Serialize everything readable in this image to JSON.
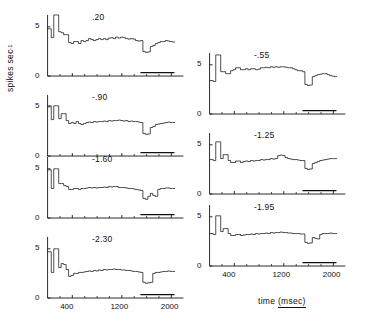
{
  "figure": {
    "axis_y_title": "spikes  sec",
    "axis_y_exponent": "-1",
    "axis_x_title_main": "time",
    "axis_x_title_unit": "(msec)"
  },
  "chart_data": {
    "type": "line",
    "title": "",
    "xlabel": "time (msec)",
    "ylabel": "spikes sec-1",
    "xlim": [
      0,
      2100
    ],
    "ylim": [
      0,
      6.2
    ],
    "xticks": [
      400,
      1200,
      2000
    ],
    "xticklabels": [
      "400",
      "1200",
      "2000"
    ],
    "yticks": [
      0,
      5
    ],
    "yticklabels": [
      "0",
      "5"
    ],
    "grid": false,
    "legend": "none",
    "stimulus_marker": {
      "label": "",
      "x_start": 1500,
      "x_end": 2050,
      "y": 0.35
    },
    "panels": [
      {
        "name": "panel-0-20",
        "label": ".20",
        "column": "left",
        "x": [
          0,
          60,
          100,
          140,
          180,
          220,
          260,
          300,
          340,
          380,
          420,
          460,
          500,
          540,
          580,
          620,
          660,
          700,
          740,
          780,
          820,
          860,
          900,
          940,
          980,
          1020,
          1060,
          1100,
          1140,
          1180,
          1220,
          1260,
          1300,
          1340,
          1380,
          1420,
          1460,
          1500,
          1540,
          1580,
          1620,
          1660,
          1700,
          1740,
          1780,
          1820,
          1860,
          1900,
          1940,
          1980,
          2020,
          2060
        ],
        "y": [
          4.8,
          3.9,
          6.2,
          6.2,
          4.5,
          4.4,
          4.2,
          4.2,
          3.4,
          3.3,
          3.5,
          3.5,
          3.3,
          3.6,
          3.5,
          3.6,
          3.8,
          3.7,
          3.6,
          3.7,
          3.8,
          3.7,
          3.8,
          3.7,
          3.85,
          3.9,
          3.8,
          3.95,
          3.85,
          3.95,
          3.9,
          3.8,
          3.75,
          3.8,
          3.75,
          3.6,
          3.55,
          3.6,
          2.5,
          2.4,
          2.45,
          3.0,
          3.1,
          3.3,
          3.4,
          3.5,
          3.5,
          3.6,
          3.55,
          3.5,
          3.45,
          3.45
        ]
      },
      {
        "name": "panel-minus-90",
        "label": "-.90",
        "column": "left",
        "x": [
          0,
          60,
          100,
          140,
          180,
          220,
          260,
          300,
          340,
          380,
          420,
          460,
          500,
          540,
          580,
          620,
          660,
          700,
          740,
          780,
          820,
          860,
          900,
          940,
          980,
          1020,
          1060,
          1100,
          1140,
          1180,
          1220,
          1260,
          1300,
          1340,
          1380,
          1420,
          1460,
          1500,
          1540,
          1580,
          1620,
          1660,
          1700,
          1740,
          1780,
          1820,
          1860,
          1900,
          1940,
          1980,
          2020,
          2060
        ],
        "y": [
          5.1,
          3.7,
          5.1,
          5.1,
          3.8,
          4.3,
          4.3,
          3.6,
          3.3,
          3.4,
          3.3,
          3.5,
          3.3,
          3.2,
          3.3,
          3.4,
          3.45,
          3.4,
          3.5,
          3.45,
          3.5,
          3.5,
          3.55,
          3.5,
          3.6,
          3.55,
          3.6,
          3.6,
          3.65,
          3.6,
          3.55,
          3.6,
          3.5,
          3.55,
          3.5,
          3.5,
          3.45,
          3.4,
          2.3,
          2.2,
          2.25,
          2.9,
          3.0,
          3.2,
          3.25,
          3.3,
          3.35,
          3.4,
          3.45,
          3.4,
          3.4,
          3.4
        ]
      },
      {
        "name": "panel-minus-1-60",
        "label": "-1.60",
        "column": "left",
        "x": [
          0,
          60,
          100,
          140,
          180,
          220,
          260,
          300,
          340,
          380,
          420,
          460,
          500,
          540,
          580,
          620,
          660,
          700,
          740,
          780,
          820,
          860,
          900,
          940,
          980,
          1020,
          1060,
          1100,
          1140,
          1180,
          1220,
          1260,
          1300,
          1340,
          1380,
          1420,
          1460,
          1500,
          1540,
          1580,
          1620,
          1660,
          1700,
          1740,
          1780,
          1820,
          1860,
          1900,
          1940,
          1980,
          2020,
          2060
        ],
        "y": [
          4.9,
          3.0,
          5.0,
          5.0,
          3.5,
          3.5,
          3.3,
          3.2,
          2.9,
          2.9,
          3.0,
          3.0,
          2.9,
          3.0,
          3.0,
          3.05,
          3.1,
          3.05,
          3.1,
          3.05,
          3.1,
          3.1,
          3.15,
          3.1,
          3.2,
          3.15,
          3.2,
          3.2,
          3.1,
          3.1,
          3.1,
          3.05,
          3.0,
          3.0,
          2.95,
          2.9,
          2.85,
          2.8,
          2.0,
          1.9,
          2.2,
          2.5,
          2.3,
          2.2,
          2.9,
          3.0,
          3.0,
          3.05,
          3.05,
          3.0,
          3.0,
          3.0
        ]
      },
      {
        "name": "panel-minus-2-30",
        "label": "-2.30",
        "column": "left",
        "x": [
          0,
          60,
          100,
          140,
          180,
          220,
          260,
          300,
          340,
          380,
          420,
          460,
          500,
          540,
          580,
          620,
          660,
          700,
          740,
          780,
          820,
          860,
          900,
          940,
          980,
          1020,
          1060,
          1100,
          1140,
          1180,
          1220,
          1260,
          1300,
          1340,
          1380,
          1420,
          1460,
          1500,
          1540,
          1580,
          1620,
          1660,
          1700,
          1740,
          1780,
          1820,
          1860,
          1900,
          1940,
          1980,
          2020,
          2060
        ],
        "y": [
          4.7,
          2.6,
          5.0,
          5.0,
          3.1,
          3.5,
          3.4,
          2.9,
          2.2,
          2.3,
          2.5,
          2.5,
          2.6,
          2.6,
          2.65,
          2.7,
          2.75,
          2.7,
          2.8,
          2.75,
          2.85,
          2.8,
          2.9,
          2.85,
          2.9,
          2.9,
          2.95,
          2.9,
          2.9,
          2.85,
          2.85,
          2.8,
          2.8,
          2.75,
          2.7,
          2.7,
          2.65,
          2.6,
          1.6,
          1.5,
          1.55,
          1.6,
          2.5,
          2.6,
          2.6,
          2.65,
          2.7,
          2.7,
          2.75,
          2.7,
          2.7,
          2.7
        ]
      },
      {
        "name": "panel-minus-55",
        "label": "-.55",
        "column": "right",
        "x": [
          0,
          60,
          100,
          140,
          180,
          220,
          260,
          300,
          340,
          380,
          420,
          460,
          500,
          540,
          580,
          620,
          660,
          700,
          740,
          780,
          820,
          860,
          900,
          940,
          980,
          1020,
          1060,
          1100,
          1140,
          1180,
          1220,
          1260,
          1300,
          1340,
          1380,
          1420,
          1460,
          1500,
          1540,
          1580,
          1620,
          1660,
          1700,
          1740,
          1780,
          1820,
          1860,
          1900,
          1940,
          1980,
          2020,
          2060
        ],
        "y": [
          3.4,
          3.3,
          6.0,
          6.0,
          4.3,
          4.3,
          4.1,
          4.1,
          4.4,
          4.5,
          4.7,
          4.7,
          4.5,
          4.5,
          4.6,
          4.5,
          4.6,
          4.6,
          4.5,
          4.55,
          4.7,
          4.7,
          4.75,
          4.7,
          4.8,
          4.75,
          4.8,
          4.75,
          4.8,
          4.8,
          4.75,
          4.7,
          4.7,
          4.6,
          4.5,
          4.4,
          4.4,
          4.3,
          3.0,
          2.9,
          2.95,
          3.8,
          3.9,
          4.0,
          4.05,
          4.1,
          4.1,
          4.0,
          3.9,
          3.85,
          3.8,
          3.8
        ]
      },
      {
        "name": "panel-minus-1-25",
        "label": "-1.25",
        "column": "right",
        "x": [
          0,
          60,
          100,
          140,
          180,
          220,
          260,
          300,
          340,
          380,
          420,
          460,
          500,
          540,
          580,
          620,
          660,
          700,
          740,
          780,
          820,
          860,
          900,
          940,
          980,
          1020,
          1060,
          1100,
          1140,
          1180,
          1220,
          1260,
          1300,
          1340,
          1380,
          1420,
          1460,
          1500,
          1540,
          1580,
          1620,
          1660,
          1700,
          1740,
          1780,
          1820,
          1860,
          1900,
          1940,
          1980,
          2020,
          2060
        ],
        "y": [
          3.5,
          3.4,
          5.3,
          5.3,
          3.6,
          4.0,
          4.0,
          3.4,
          3.2,
          3.2,
          3.35,
          3.35,
          3.2,
          3.3,
          3.35,
          3.3,
          3.4,
          3.35,
          3.4,
          3.4,
          3.5,
          3.45,
          3.5,
          3.5,
          3.6,
          3.55,
          3.6,
          3.9,
          3.95,
          3.9,
          3.7,
          3.6,
          3.55,
          3.5,
          3.5,
          3.45,
          3.4,
          3.4,
          2.6,
          2.5,
          2.55,
          3.1,
          3.2,
          3.3,
          3.4,
          3.45,
          3.5,
          3.55,
          3.6,
          3.6,
          3.6,
          3.6
        ]
      },
      {
        "name": "panel-minus-1-95",
        "label": "-1.95",
        "column": "right",
        "x": [
          0,
          60,
          100,
          140,
          180,
          220,
          260,
          300,
          340,
          380,
          420,
          460,
          500,
          540,
          580,
          620,
          660,
          700,
          740,
          780,
          820,
          860,
          900,
          940,
          980,
          1020,
          1060,
          1100,
          1140,
          1180,
          1220,
          1260,
          1300,
          1340,
          1380,
          1420,
          1460,
          1500,
          1540,
          1580,
          1620,
          1660,
          1700,
          1740,
          1780,
          1820,
          1860,
          1900,
          1940,
          1980,
          2020,
          2060
        ],
        "y": [
          3.3,
          3.2,
          5.1,
          5.1,
          3.5,
          3.8,
          3.8,
          3.3,
          3.1,
          3.1,
          3.2,
          3.2,
          3.1,
          3.15,
          3.2,
          3.2,
          3.25,
          3.2,
          3.3,
          3.25,
          3.3,
          3.3,
          3.35,
          3.3,
          3.4,
          3.35,
          3.4,
          3.4,
          3.45,
          3.4,
          3.4,
          3.35,
          3.35,
          3.3,
          3.3,
          3.3,
          3.25,
          3.25,
          2.4,
          2.3,
          2.35,
          2.9,
          2.8,
          2.75,
          3.2,
          3.3,
          3.3,
          3.3,
          3.35,
          3.3,
          3.3,
          3.3
        ]
      }
    ]
  }
}
